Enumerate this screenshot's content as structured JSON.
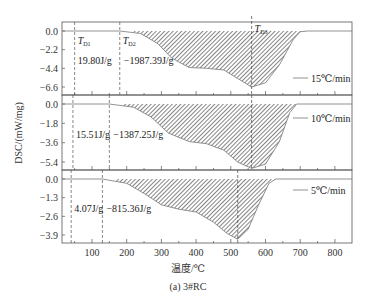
{
  "chart_data": {
    "type": "area",
    "title": "",
    "caption": "(a) 3#RC",
    "xlabel": "温度/℃",
    "ylabel": "DSC/(mW/mg)",
    "xlim": [
      15,
      850
    ],
    "x_ticks": [
      100,
      200,
      300,
      400,
      500,
      600,
      700,
      800
    ],
    "grid": false,
    "panels": [
      {
        "name": "15℃/min",
        "legend": "15℃/min",
        "yticks": [
          "0.0",
          "−2.2",
          "−4.4",
          "−6.6"
        ],
        "ylim": [
          -7.4,
          0.8
        ],
        "TD1": 50,
        "TD2": 180,
        "TD3": 560,
        "TD1_label": "T",
        "TD1_sub": "D1",
        "TD2_label": "T",
        "TD2_sub": "D2",
        "TD3_label": "T",
        "TD3_sub": "D3",
        "enthalpy_1": "19.80J/g",
        "enthalpy_2": "−1987.39J/g",
        "x": [
          15,
          50,
          100,
          180,
          240,
          290,
          330,
          380,
          430,
          480,
          520,
          560,
          600,
          640,
          680,
          700,
          720,
          850
        ],
        "y": [
          0.0,
          0.1,
          0.1,
          0.0,
          -0.3,
          -1.5,
          -3.2,
          -4.3,
          -4.4,
          -4.6,
          -5.6,
          -6.6,
          -6.1,
          -4.0,
          -1.0,
          -0.1,
          0.0,
          0.0
        ]
      },
      {
        "name": "10℃/min",
        "legend": "10℃/min",
        "yticks": [
          "0.0",
          "−1.8",
          "−3.6",
          "−5.4"
        ],
        "ylim": [
          -6.3,
          0.6
        ],
        "TD1": 45,
        "TD2": 150,
        "TD3": 560,
        "enthalpy_1": "15.51J/g",
        "enthalpy_2": "−1387.25J/g",
        "x": [
          15,
          45,
          100,
          150,
          220,
          270,
          320,
          380,
          430,
          480,
          520,
          560,
          600,
          640,
          670,
          690,
          850
        ],
        "y": [
          0.0,
          0.1,
          0.1,
          0.0,
          -0.3,
          -1.2,
          -2.7,
          -3.5,
          -3.7,
          -4.3,
          -5.4,
          -6.0,
          -5.6,
          -3.5,
          -0.8,
          0.0,
          0.0
        ]
      },
      {
        "name": "5℃/min",
        "legend": "5℃/min",
        "yticks": [
          "0.0",
          "−1.3",
          "−2.6",
          "−3.9"
        ],
        "ylim": [
          -4.4,
          0.4
        ],
        "TD1": 40,
        "TD2": 130,
        "TD3": 520,
        "enthalpy_1": "4.07J/g",
        "enthalpy_2": "−815.36J/g",
        "x": [
          15,
          40,
          100,
          130,
          200,
          250,
          300,
          350,
          400,
          450,
          490,
          520,
          550,
          580,
          610,
          630,
          850
        ],
        "y": [
          0.0,
          0.05,
          0.05,
          0.0,
          -0.3,
          -1.0,
          -1.8,
          -2.1,
          -2.3,
          -3.0,
          -3.8,
          -4.2,
          -3.5,
          -1.8,
          -0.3,
          0.0,
          0.0
        ]
      }
    ]
  }
}
